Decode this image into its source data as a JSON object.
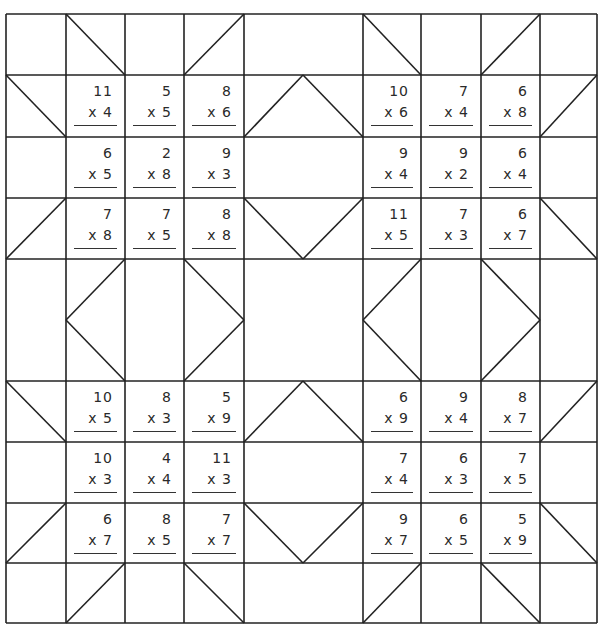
{
  "worksheet": {
    "title": "",
    "grid": {
      "cols_x": [
        6,
        66,
        125,
        184,
        244,
        303,
        363,
        421,
        481,
        540,
        597
      ],
      "rows_y": [
        14,
        75,
        137,
        198,
        259,
        320,
        381,
        442,
        503,
        563,
        623
      ],
      "line_color": "#222222"
    },
    "operator": "x",
    "blocks": [
      {
        "name": "top-left-star",
        "problems": [
          {
            "a": "11",
            "b": "4"
          },
          {
            "a": "5",
            "b": "5"
          },
          {
            "a": "8",
            "b": "6"
          },
          {
            "a": "6",
            "b": "5"
          },
          {
            "a": "2",
            "b": "8"
          },
          {
            "a": "9",
            "b": "3"
          },
          {
            "a": "7",
            "b": "8"
          },
          {
            "a": "7",
            "b": "5"
          },
          {
            "a": "8",
            "b": "8"
          }
        ]
      },
      {
        "name": "top-right-star",
        "problems": [
          {
            "a": "10",
            "b": "6"
          },
          {
            "a": "7",
            "b": "4"
          },
          {
            "a": "6",
            "b": "8"
          },
          {
            "a": "9",
            "b": "4"
          },
          {
            "a": "9",
            "b": "2"
          },
          {
            "a": "6",
            "b": "4"
          },
          {
            "a": "11",
            "b": "5"
          },
          {
            "a": "7",
            "b": "3"
          },
          {
            "a": "6",
            "b": "7"
          }
        ]
      },
      {
        "name": "bottom-left-star",
        "problems": [
          {
            "a": "10",
            "b": "5"
          },
          {
            "a": "8",
            "b": "3"
          },
          {
            "a": "5",
            "b": "9"
          },
          {
            "a": "10",
            "b": "3"
          },
          {
            "a": "4",
            "b": "4"
          },
          {
            "a": "11",
            "b": "3"
          },
          {
            "a": "6",
            "b": "7"
          },
          {
            "a": "8",
            "b": "5"
          },
          {
            "a": "7",
            "b": "7"
          }
        ]
      },
      {
        "name": "bottom-right-star",
        "problems": [
          {
            "a": "6",
            "b": "9"
          },
          {
            "a": "9",
            "b": "4"
          },
          {
            "a": "8",
            "b": "7"
          },
          {
            "a": "7",
            "b": "4"
          },
          {
            "a": "6",
            "b": "3"
          },
          {
            "a": "7",
            "b": "5"
          },
          {
            "a": "9",
            "b": "7"
          },
          {
            "a": "6",
            "b": "5"
          },
          {
            "a": "5",
            "b": "9"
          }
        ]
      }
    ]
  }
}
